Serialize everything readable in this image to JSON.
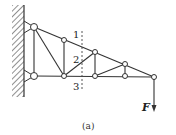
{
  "figure": {
    "caption": "(a)",
    "section_labels": [
      "1",
      "2",
      "3"
    ],
    "force_label": "F",
    "colors": {
      "line": "#333333",
      "background": "#ffffff"
    }
  }
}
